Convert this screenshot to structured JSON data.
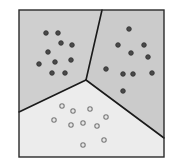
{
  "diagram": {
    "type": "voronoi-partition",
    "frame": {
      "x": 19,
      "y": 10,
      "width": 145,
      "height": 147,
      "stroke": "#2a2a2a"
    },
    "junction": {
      "x": 86,
      "y": 80
    },
    "boundaries": [
      {
        "name": "boundary-top",
        "from": [
          102,
          10
        ],
        "to": [
          86,
          80
        ]
      },
      {
        "name": "boundary-left",
        "from": [
          86,
          80
        ],
        "to": [
          19,
          112
        ]
      },
      {
        "name": "boundary-right",
        "from": [
          86,
          80
        ],
        "to": [
          164,
          138
        ]
      }
    ],
    "regions": [
      {
        "name": "region-left",
        "fill": "#cfcfcf",
        "polygon": [
          [
            19,
            10
          ],
          [
            102,
            10
          ],
          [
            86,
            80
          ],
          [
            19,
            112
          ]
        ],
        "point_style": "filled",
        "points": [
          [
            46,
            33
          ],
          [
            58,
            33
          ],
          [
            61,
            43
          ],
          [
            72,
            45
          ],
          [
            48,
            52
          ],
          [
            39,
            64
          ],
          [
            55,
            62
          ],
          [
            71,
            60
          ],
          [
            52,
            73
          ],
          [
            65,
            73
          ]
        ]
      },
      {
        "name": "region-right",
        "fill": "#cbcbcb",
        "polygon": [
          [
            102,
            10
          ],
          [
            164,
            10
          ],
          [
            164,
            138
          ],
          [
            86,
            80
          ]
        ],
        "point_style": "filled",
        "points": [
          [
            129,
            29
          ],
          [
            118,
            45
          ],
          [
            144,
            45
          ],
          [
            131,
            53
          ],
          [
            148,
            57
          ],
          [
            106,
            69
          ],
          [
            123,
            74
          ],
          [
            133,
            74
          ],
          [
            152,
            73
          ],
          [
            123,
            91
          ]
        ]
      },
      {
        "name": "region-bottom",
        "fill": "#ececec",
        "polygon": [
          [
            19,
            112
          ],
          [
            86,
            80
          ],
          [
            164,
            138
          ],
          [
            164,
            157
          ],
          [
            19,
            157
          ]
        ],
        "point_style": "hollow",
        "points": [
          [
            62,
            106
          ],
          [
            73,
            111
          ],
          [
            90,
            109
          ],
          [
            54,
            120
          ],
          [
            71,
            125
          ],
          [
            83,
            123
          ],
          [
            97,
            126
          ],
          [
            106,
            117
          ],
          [
            104,
            140
          ],
          [
            83,
            145
          ]
        ]
      }
    ],
    "colors": {
      "line": "#1a1a1a",
      "filled_point": "#4a4a4a",
      "filled_point_ring": "#2e2e2e",
      "hollow_point_ring": "#7a7a7a",
      "hollow_point_fill": "#e6e6e6"
    }
  }
}
